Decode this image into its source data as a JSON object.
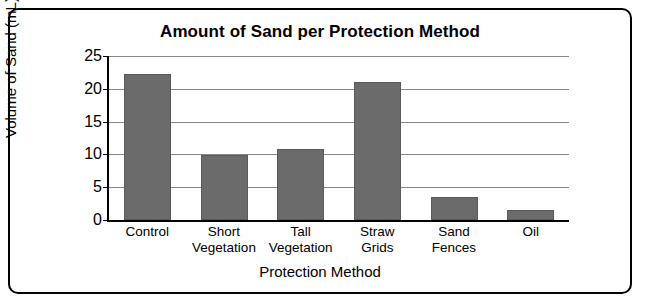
{
  "chart_data": {
    "type": "bar",
    "title": "Amount of Sand per Protection Method",
    "xlabel": "Protection Method",
    "ylabel": "Volume of Sand (mL)",
    "categories": [
      "Control",
      "Short Vegetation",
      "Tall Vegetation",
      "Straw Grids",
      "Sand Fences",
      "Oil"
    ],
    "category_lines": [
      [
        "Control"
      ],
      [
        "Short",
        "Vegetation"
      ],
      [
        "Tall",
        "Vegetation"
      ],
      [
        "Straw",
        "Grids"
      ],
      [
        "Sand",
        "Fences"
      ],
      [
        "Oil"
      ]
    ],
    "values": [
      22.3,
      9.9,
      10.8,
      21.1,
      3.5,
      1.5
    ],
    "ylim": [
      0,
      25
    ],
    "yticks": [
      "0",
      "5",
      "10",
      "15",
      "20",
      "25"
    ],
    "ytick_values": [
      0,
      5,
      10,
      15,
      20,
      25
    ],
    "grid": true,
    "legend": "none",
    "bar_color": "#6b6b6b",
    "axis_color": "#000000",
    "grid_color": "#888888",
    "background": "#ffffff"
  }
}
